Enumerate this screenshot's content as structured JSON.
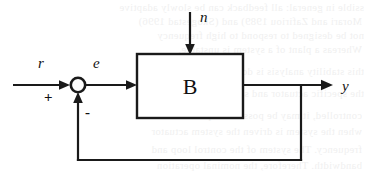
{
  "figure": {
    "kind": "block-diagram",
    "background_color": "#ffffff",
    "line_color": "#1a1a1a"
  },
  "blocks": [
    {
      "id": "plant",
      "label": "B",
      "shape": "rectangle"
    }
  ],
  "junction": {
    "id": "summing-junction",
    "shape": "circle",
    "plus_sign": "+",
    "minus_sign": "-"
  },
  "signals": {
    "reference": "r",
    "error": "e",
    "disturbance": "n",
    "output": "y"
  },
  "bleed_through_text": [
    "ssible in general: all feedback can be slowly adaptive",
    "Morari and Zafiriou 1989) and (Skogestad 1996)",
    "not be designed to respond to high frequency",
    "Whereas a plant of a system is unstable,",
    "this stability analysis is done with both the",
    "the specific actuator and sensor dynamics of",
    "controlled, it may be possible to perform the",
    "when the system is driven the system actuator",
    "frequency. The system of the control loop and",
    "bandwidth. Therefore, the nominal operation"
  ]
}
